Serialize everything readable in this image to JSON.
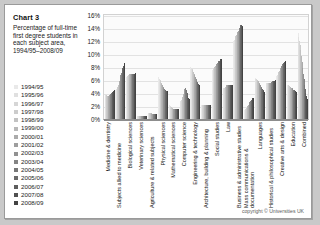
{
  "caption": {
    "chart_label": "Chart 3",
    "description": "Percentage of full-time first degree students in each subject area, 1994/95–2008/09"
  },
  "footer": {
    "copyright": "copyright © Universities UK"
  },
  "colors": {
    "paper": "#ffffff",
    "page_background": "#c9c9c9",
    "plot_background": "#fbfbfb",
    "gridline": "#e2e2e2",
    "axis": "#8d8d8d",
    "text": "#1b1b1b"
  },
  "chart_data": {
    "type": "bar",
    "title": "Chart 3",
    "subtitle": "Percentage of full-time first degree students in each subject area, 1994/95–2008/09",
    "xlabel": "",
    "ylabel": "",
    "ylim": [
      0,
      16
    ],
    "ytick_labels": [
      "16%",
      "14%",
      "12%",
      "10%",
      "8%",
      "6%",
      "4%",
      "2%",
      "0%"
    ],
    "yticks": [
      16,
      14,
      12,
      10,
      8,
      6,
      4,
      2,
      0
    ],
    "grid": true,
    "legend_position": "left",
    "series_colors": [
      "#e9e9e9",
      "#e0e0e0",
      "#d6d6d6",
      "#cccccc",
      "#c2c2c2",
      "#b8b8b8",
      "#ababab",
      "#9e9e9e",
      "#919191",
      "#848484",
      "#777777",
      "#6a6a6a",
      "#5d5d5d",
      "#505050",
      "#434343"
    ],
    "categories": [
      "Medicine & dentistry",
      "Subjects allied to medicine",
      "Biological sciences",
      "Veterinary sciences",
      "Agriculture & related subjects",
      "Physical sciences",
      "Mathematical sciences",
      "Computer science",
      "Engineering & technology",
      "Architecture, building & planning",
      "Social studies",
      "Law",
      "Business & administrative studies",
      "Mass communications & documentation",
      "Languages",
      "Historical & philosophical studies",
      "Creative arts & design",
      "Education",
      "Combined"
    ],
    "series": [
      {
        "name": "1994/95",
        "values": [
          3.8,
          4.4,
          6.4,
          0.4,
          1.0,
          6.4,
          2.1,
          2.6,
          8.0,
          2.2,
          7.5,
          4.6,
          12.0,
          1.4,
          6.3,
          5.6,
          6.6,
          5.3,
          13.2
        ]
      },
      {
        "name": "1995/96",
        "values": [
          3.8,
          4.6,
          6.5,
          0.4,
          1.0,
          6.2,
          2.0,
          2.7,
          7.9,
          2.2,
          7.6,
          4.7,
          12.2,
          1.5,
          6.2,
          5.6,
          6.8,
          5.3,
          12.6
        ]
      },
      {
        "name": "1996/97",
        "values": [
          3.7,
          4.8,
          6.6,
          0.4,
          1.0,
          6.0,
          1.9,
          2.9,
          7.7,
          2.2,
          7.8,
          4.8,
          12.5,
          1.6,
          6.1,
          5.6,
          7.0,
          5.2,
          12.0
        ]
      },
      {
        "name": "1997/98",
        "values": [
          3.7,
          5.0,
          6.7,
          0.4,
          0.9,
          5.8,
          1.8,
          3.1,
          7.5,
          2.2,
          7.9,
          4.9,
          12.7,
          1.7,
          6.0,
          5.6,
          7.2,
          5.1,
          11.4
        ]
      },
      {
        "name": "1998/99",
        "values": [
          3.6,
          5.3,
          6.8,
          0.4,
          0.9,
          5.6,
          1.7,
          3.4,
          7.3,
          2.2,
          8.0,
          5.0,
          13.0,
          1.9,
          5.9,
          5.6,
          7.4,
          5.0,
          10.6
        ]
      },
      {
        "name": "1999/00",
        "values": [
          3.6,
          5.6,
          6.9,
          0.4,
          0.9,
          5.4,
          1.6,
          3.8,
          7.0,
          2.2,
          8.2,
          5.1,
          13.2,
          2.0,
          5.8,
          5.6,
          7.6,
          4.9,
          9.7
        ]
      },
      {
        "name": "2000/01",
        "values": [
          3.6,
          5.9,
          7.0,
          0.4,
          0.8,
          5.2,
          1.6,
          4.2,
          6.8,
          2.2,
          8.3,
          5.2,
          13.4,
          2.2,
          5.6,
          5.6,
          7.8,
          4.8,
          8.8
        ]
      },
      {
        "name": "2001/02",
        "values": [
          3.7,
          6.3,
          7.0,
          0.4,
          0.8,
          5.0,
          1.5,
          4.6,
          6.5,
          2.2,
          8.5,
          5.2,
          13.6,
          2.4,
          5.4,
          5.6,
          8.0,
          4.7,
          7.8
        ]
      },
      {
        "name": "2002/03",
        "values": [
          3.8,
          6.7,
          7.0,
          0.4,
          0.8,
          4.8,
          1.5,
          4.8,
          6.2,
          2.2,
          8.6,
          5.2,
          13.8,
          2.6,
          5.2,
          5.7,
          8.2,
          4.6,
          6.9
        ]
      },
      {
        "name": "2003/04",
        "values": [
          3.9,
          7.1,
          7.0,
          0.4,
          0.7,
          4.6,
          1.5,
          4.7,
          5.9,
          2.2,
          8.8,
          5.2,
          14.0,
          2.8,
          5.0,
          5.7,
          8.4,
          4.5,
          6.1
        ]
      },
      {
        "name": "2004/05",
        "values": [
          4.0,
          7.5,
          7.0,
          0.4,
          0.7,
          4.5,
          1.5,
          4.4,
          5.7,
          2.2,
          8.9,
          5.2,
          14.2,
          2.9,
          4.8,
          5.8,
          8.5,
          4.4,
          5.3
        ]
      },
      {
        "name": "2005/06",
        "values": [
          4.1,
          7.9,
          7.0,
          0.4,
          0.7,
          4.4,
          1.5,
          4.0,
          5.5,
          2.2,
          9.0,
          5.2,
          14.4,
          3.0,
          4.6,
          5.8,
          8.6,
          4.4,
          4.6
        ]
      },
      {
        "name": "2006/07",
        "values": [
          4.2,
          8.2,
          7.0,
          0.4,
          0.7,
          4.3,
          1.5,
          3.6,
          5.4,
          2.2,
          9.1,
          5.2,
          14.4,
          3.1,
          4.4,
          5.9,
          8.7,
          4.3,
          4.0
        ]
      },
      {
        "name": "2007/08",
        "values": [
          4.3,
          8.4,
          7.0,
          0.4,
          0.7,
          4.3,
          1.5,
          3.3,
          5.3,
          2.2,
          9.2,
          5.2,
          14.3,
          3.2,
          4.3,
          5.9,
          8.8,
          4.3,
          3.5
        ]
      },
      {
        "name": "2008/09",
        "values": [
          4.4,
          8.6,
          7.1,
          0.4,
          0.7,
          4.3,
          1.5,
          3.1,
          5.3,
          2.2,
          9.3,
          5.2,
          14.2,
          3.3,
          4.2,
          6.0,
          8.9,
          4.2,
          3.1
        ]
      }
    ]
  }
}
